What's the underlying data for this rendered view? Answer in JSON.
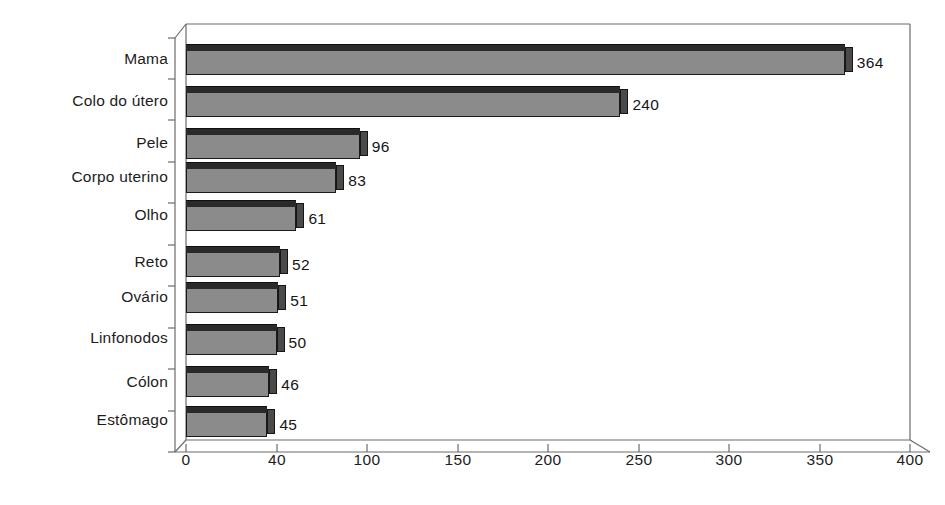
{
  "chart_data": {
    "type": "bar",
    "orientation": "horizontal",
    "title": "",
    "subtitle": "",
    "xlabel": "",
    "ylabel": "",
    "xlim": [
      0,
      400
    ],
    "ylim": null,
    "grid": false,
    "legend": null,
    "categories": [
      "Mama",
      "Colo do útero",
      "Pele",
      "Corpo uterino",
      "Olho",
      "Reto",
      "Ovário",
      "Linfonodos",
      "Cólon",
      "Estômago"
    ],
    "values": [
      364,
      240,
      96,
      83,
      61,
      52,
      51,
      50,
      46,
      45
    ],
    "data_labels": [
      "364",
      "240",
      "96",
      "83",
      "61",
      "52",
      "51",
      "50",
      "46",
      "45"
    ],
    "xticks": [
      0,
      50,
      100,
      150,
      200,
      250,
      300,
      350,
      400
    ],
    "xtick_labels": [
      "0",
      "40",
      "100",
      "150",
      "200",
      "250",
      "300",
      "350",
      "400"
    ],
    "bar_style": "3d-block",
    "colors": {
      "bar_face": "#8b8b8b",
      "bar_top": "#2a2a2a",
      "bar_side": "#4a4a4a",
      "outline": "#1a1a1a",
      "frame": "#555555",
      "text": "#1c1c1c",
      "background": "#ffffff"
    }
  },
  "bleed_text": ""
}
